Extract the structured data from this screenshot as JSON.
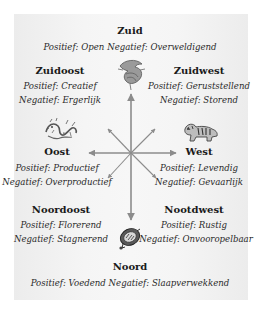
{
  "diagram": {
    "colors": {
      "panel": "#f4f4f4",
      "arrow": "#8c8c8c",
      "text": "#1a1a1a"
    },
    "directions": {
      "zuid": {
        "title": "Zuid",
        "line": "Positief: Open Negatief: Overweldigend",
        "icon": "phoenix-icon"
      },
      "zuidoost": {
        "title": "Zuidoost",
        "positief": "Positief: Creatief",
        "negatief": "Negatief: Ergerlijk"
      },
      "zuidwest": {
        "title": "Zuidwest",
        "positief": "Positief: Geruststellend",
        "negatief": "Negatief: Storend"
      },
      "oost": {
        "title": "Oost",
        "positief": "Positief: Productief",
        "negatief": "Negatief: Overproductief",
        "icon": "dragon-icon"
      },
      "west": {
        "title": "West",
        "positief": "Positief: Levendig",
        "negatief": "Negatief: Gevaarlijk",
        "icon": "tiger-icon"
      },
      "noordoost": {
        "title": "Noordoost",
        "positief": "Positief: Florerend",
        "negatief": "Negatief: Stagnerend"
      },
      "nootdwest": {
        "title": "Nootdwest",
        "positief": "Positief: Rustig",
        "negatief": "Negatief: Onvooropelbaar"
      },
      "noord": {
        "title": "Noord",
        "line": "Positief: Voedend Negatief: Slaapverwekkend",
        "icon": "turtle-icon"
      }
    }
  }
}
